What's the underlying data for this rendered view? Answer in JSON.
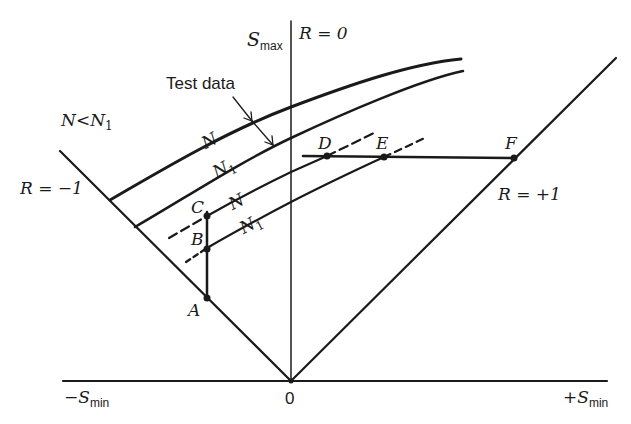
{
  "diagram": {
    "title": "",
    "axes": {
      "y_axis_label": "S",
      "y_axis_sub": "max",
      "x_neg_label": "−S",
      "x_neg_sub": "min",
      "x_pos_label": "+S",
      "x_pos_sub": "min",
      "origin_label": "0"
    },
    "lines": {
      "r_zero": "R = 0",
      "r_neg": "R = −1",
      "r_pos": "R = +1"
    },
    "annotations": {
      "test_data": "Test data",
      "n_lt_n1_a": "N",
      "n_lt_n1_op": "<",
      "n_lt_n1_b": "N",
      "n_lt_n1_sub": "1"
    },
    "curves": [
      {
        "label": "N",
        "sub": ""
      },
      {
        "label": "N",
        "sub": "1"
      },
      {
        "label": "N",
        "sub": ""
      },
      {
        "label": "N",
        "sub": "1"
      }
    ],
    "points": {
      "A": "A",
      "B": "B",
      "C": "C",
      "D": "D",
      "E": "E",
      "F": "F"
    },
    "colors": {
      "ink": "#1a1a1a",
      "background": "#ffffff"
    }
  }
}
